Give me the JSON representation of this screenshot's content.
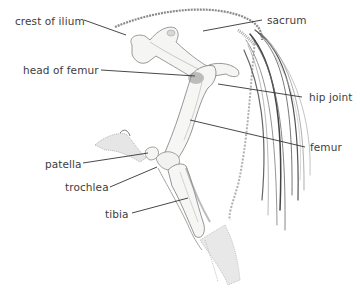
{
  "diagram": {
    "colors": {
      "background": "#ffffff",
      "label_text": "#3d3d3d",
      "leader_line": "#333333",
      "bone_fill": "#f4f4f2",
      "bone_outline": "#9a9a9a",
      "shade": "#8c8c8c",
      "tail_stroke": "#6e6e6e"
    },
    "labels": [
      {
        "id": "crest-of-ilium",
        "text": "crest of ilium",
        "x": 15,
        "y": 15
      },
      {
        "id": "sacrum",
        "text": "sacrum",
        "x": 267,
        "y": 14
      },
      {
        "id": "head-of-femur",
        "text": "head of femur",
        "x": 23,
        "y": 64
      },
      {
        "id": "hip-joint",
        "text": "hip joint",
        "x": 309,
        "y": 91
      },
      {
        "id": "femur",
        "text": "femur",
        "x": 310,
        "y": 141
      },
      {
        "id": "patella",
        "text": "patella",
        "x": 45,
        "y": 158
      },
      {
        "id": "trochlea",
        "text": "trochlea",
        "x": 65,
        "y": 181
      },
      {
        "id": "tibia",
        "text": "tibia",
        "x": 105,
        "y": 208
      }
    ]
  }
}
